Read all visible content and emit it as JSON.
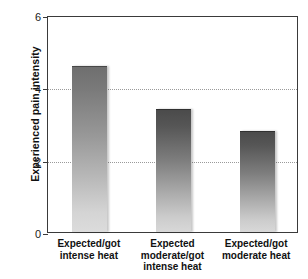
{
  "chart_data": {
    "type": "bar",
    "title": "",
    "xlabel": "",
    "ylabel": "Experienced pain intensity",
    "categories": [
      "Expected/got intense heat",
      "Expected moderate/got intense heat",
      "Expected/got moderate heat"
    ],
    "category_lines": [
      [
        "Expected/got",
        "intense heat"
      ],
      [
        "Expected",
        "moderate/got",
        "intense heat"
      ],
      [
        "Expected/got",
        "moderate heat"
      ]
    ],
    "values": [
      4.6,
      3.4,
      2.8
    ],
    "ylim": [
      0,
      6
    ],
    "yticks": [
      0,
      2,
      4,
      6
    ],
    "ytick_labels": [
      "0",
      "2",
      "4",
      "6"
    ],
    "gridlines": [
      2,
      4
    ],
    "grid": true,
    "legend": null,
    "bar_styles": [
      "light-gradient",
      "dark-gradient",
      "dark-gradient"
    ],
    "colors": {
      "bar_top_light": "#6e6e6e",
      "bar_top_dark": "#4a4a4a",
      "bar_bottom": "#dcdcdc",
      "axis": "#3a3a3a",
      "gridline": "#9a9a9a",
      "text": "#111111",
      "background": "#ffffff"
    }
  }
}
